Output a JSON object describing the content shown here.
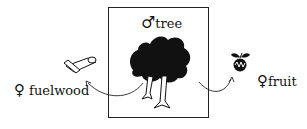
{
  "diagram": {
    "center": {
      "symbol": "♂",
      "label": "tree"
    },
    "left": {
      "symbol": "♀",
      "label": "fuelwood"
    },
    "right": {
      "symbol": "♀",
      "label": "fruit"
    }
  },
  "colors": {
    "ink": "#111111",
    "background": "#ffffff"
  }
}
